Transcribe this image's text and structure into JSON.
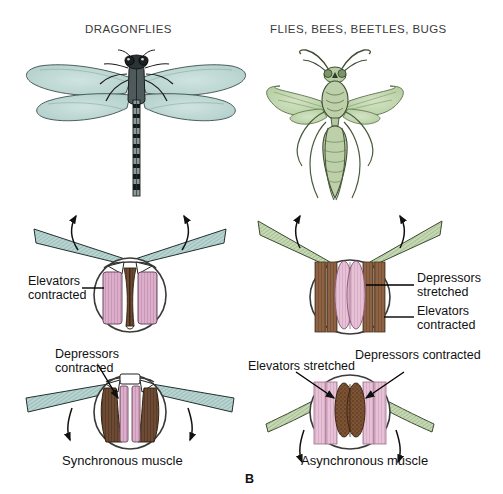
{
  "figure": {
    "panel_letter": "B",
    "columns": [
      {
        "id": "left",
        "title": "DRAGONFLIES"
      },
      {
        "id": "right",
        "title": "FLIES, BEES, BEETLES, BUGS"
      }
    ],
    "captions": {
      "left": "Synchronous muscle",
      "right": "Asynchronous muscle"
    }
  },
  "labels": {
    "upstroke_left": {
      "line1": "Elevators",
      "line2": "contracted"
    },
    "downstroke_left": {
      "line1": "Depressors",
      "line2": "contracted"
    },
    "upstroke_right_1": {
      "line1": "Depressors",
      "line2": "stretched"
    },
    "upstroke_right_2": {
      "line1": "Elevators",
      "line2": "contracted"
    },
    "downstroke_right_1": {
      "line1": "Elevators stretched",
      "line2": ""
    },
    "downstroke_right_2": {
      "line1": "Depressors contracted",
      "line2": ""
    }
  },
  "insects": {
    "dragonfly": {
      "name": "dragonfly-illustration",
      "wing_color": "#c3ddd8"
    },
    "wasp": {
      "name": "wasp-illustration",
      "wing_color": "#c6d9b4"
    }
  },
  "colors": {
    "dragonfly_wing": "#b9d4d1",
    "fly_wing": "#c0d4a8",
    "muscle_pink": "#d6a8c4",
    "muscle_pink_light": "#e3b9cf",
    "muscle_brown": "#6b4a34",
    "muscle_brown_light": "#9a6b45",
    "thorax_outline": "#3a3a3a",
    "text": "#111111"
  },
  "arrows": {
    "upstroke": "up",
    "downstroke": "down"
  }
}
